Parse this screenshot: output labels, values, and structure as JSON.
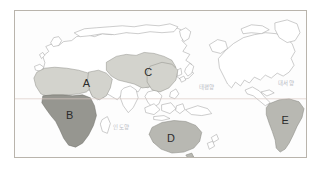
{
  "figure": {
    "frame": {
      "border_color": "#b9b4ac",
      "background": "#fdfdfd"
    }
  },
  "palette": {
    "land_fill": "#ffffff",
    "land_stroke": "#9a9a9a",
    "region_light": "#d3d3cd",
    "region_mid": "#b8b8b2",
    "region_dark": "#969690",
    "equator_line": "#d9c9c2",
    "ocean_text": "#b9bcc4",
    "label_text": "#2b2b2b",
    "frame_border": "#b9b4ac"
  },
  "map": {
    "projection": "pacific-centered",
    "equator": {
      "label": "",
      "y_fraction": 0.6
    },
    "regions": [
      {
        "id": "A",
        "label": "A",
        "name": "north-africa-middle-east",
        "shade": "light",
        "label_x": 72,
        "label_y": 74
      },
      {
        "id": "B",
        "label": "B",
        "name": "sub-saharan-africa",
        "shade": "dark",
        "label_x": 58,
        "label_y": 112
      },
      {
        "id": "C",
        "label": "C",
        "name": "east-asia-china",
        "shade": "light",
        "label_x": 132,
        "label_y": 68
      },
      {
        "id": "D",
        "label": "D",
        "name": "australia",
        "shade": "mid",
        "label_x": 158,
        "label_y": 131
      },
      {
        "id": "E",
        "label": "E",
        "name": "south-america",
        "shade": "mid",
        "label_x": 285,
        "label_y": 117
      }
    ],
    "ocean_labels": [
      {
        "id": "indian",
        "text": "인도양",
        "x": 107,
        "y": 118
      },
      {
        "id": "pacific",
        "text": "태평양",
        "x": 193,
        "y": 94
      },
      {
        "id": "atlantic",
        "text": "대서양",
        "x": 283,
        "y": 90
      }
    ]
  }
}
